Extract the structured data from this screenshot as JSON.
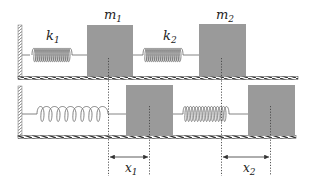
{
  "diagram": {
    "colors": {
      "mass_fill": "#9a9a9a",
      "line": "#555555",
      "background": "#ffffff"
    },
    "top_row": {
      "spring1_label": "k",
      "spring1_sub": "1",
      "spring2_label": "k",
      "spring2_sub": "2",
      "mass1_label": "m",
      "mass1_sub": "1",
      "mass2_label": "m",
      "mass2_sub": "2"
    },
    "bottom_row": {
      "disp1_label": "x",
      "disp1_sub": "1",
      "disp2_label": "x",
      "disp2_sub": "2"
    }
  }
}
